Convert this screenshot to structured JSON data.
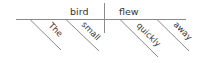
{
  "diagram": {
    "type": "reed-kellogg-sentence-diagram",
    "subject": "bird",
    "verb": "flew",
    "subject_modifiers": [
      "The",
      "small"
    ],
    "verb_modifiers": [
      "quickly",
      "away"
    ]
  },
  "colors": {
    "line": "#8a8a8a",
    "text": "#333333",
    "background": "#ffffff"
  }
}
